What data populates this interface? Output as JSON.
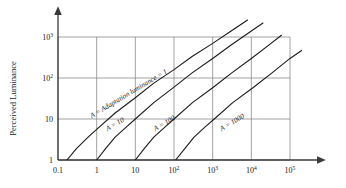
{
  "chart_data": {
    "type": "line",
    "title": "",
    "xlabel": "",
    "ylabel": "Perceived Luminance",
    "x_scale": "log",
    "y_scale": "log",
    "xlim": [
      0.1,
      100000
    ],
    "ylim": [
      1,
      1000
    ],
    "grid": true,
    "legend_position": "inline-curve-labels",
    "x_ticks": [
      {
        "value": 0.1,
        "label": "0.1"
      },
      {
        "value": 1,
        "label": "1"
      },
      {
        "value": 10,
        "label": "10"
      },
      {
        "value": 100,
        "base": "10",
        "exp": "2"
      },
      {
        "value": 1000,
        "base": "10",
        "exp": "3"
      },
      {
        "value": 10000,
        "base": "10",
        "exp": "4"
      },
      {
        "value": 100000,
        "base": "10",
        "exp": "5"
      }
    ],
    "y_ticks": [
      {
        "value": 1,
        "label": "1"
      },
      {
        "value": 10,
        "label": "10"
      },
      {
        "value": 100,
        "base": "10",
        "exp": "2"
      },
      {
        "value": 1000,
        "base": "10",
        "exp": "3"
      }
    ],
    "series": [
      {
        "name": "A = Adaptation luminance = 1",
        "label": "A = Adaptation luminance = 1",
        "adaptation_luminance": 1,
        "color": "#1a1a1a",
        "points": [
          {
            "x": 0.17,
            "y": 1
          },
          {
            "x": 0.3,
            "y": 1.9
          },
          {
            "x": 0.6,
            "y": 3.6
          },
          {
            "x": 1,
            "y": 5.6
          },
          {
            "x": 3,
            "y": 14
          },
          {
            "x": 10,
            "y": 33
          },
          {
            "x": 30,
            "y": 75
          },
          {
            "x": 100,
            "y": 160
          },
          {
            "x": 300,
            "y": 340
          },
          {
            "x": 1000,
            "y": 700
          },
          {
            "x": 3000,
            "y": 1400
          },
          {
            "x": 8000,
            "y": 2600
          }
        ]
      },
      {
        "name": "A = 10",
        "label": "A = 10",
        "adaptation_luminance": 10,
        "color": "#1a1a1a",
        "points": [
          {
            "x": 1,
            "y": 1
          },
          {
            "x": 1.7,
            "y": 1.9
          },
          {
            "x": 3,
            "y": 3.6
          },
          {
            "x": 6,
            "y": 6.5
          },
          {
            "x": 10,
            "y": 10
          },
          {
            "x": 30,
            "y": 25
          },
          {
            "x": 100,
            "y": 60
          },
          {
            "x": 300,
            "y": 135
          },
          {
            "x": 1000,
            "y": 300
          },
          {
            "x": 3000,
            "y": 640
          },
          {
            "x": 10000,
            "y": 1400
          },
          {
            "x": 20000,
            "y": 2200
          }
        ]
      },
      {
        "name": "A = 100",
        "label": "A = 100",
        "adaptation_luminance": 100,
        "color": "#1a1a1a",
        "points": [
          {
            "x": 10,
            "y": 1
          },
          {
            "x": 17,
            "y": 1.9
          },
          {
            "x": 30,
            "y": 3.6
          },
          {
            "x": 60,
            "y": 6.5
          },
          {
            "x": 100,
            "y": 10
          },
          {
            "x": 300,
            "y": 25
          },
          {
            "x": 1000,
            "y": 58
          },
          {
            "x": 3000,
            "y": 130
          },
          {
            "x": 10000,
            "y": 300
          },
          {
            "x": 30000,
            "y": 660
          },
          {
            "x": 60000,
            "y": 1100
          }
        ]
      },
      {
        "name": "A = 1000",
        "label": "A = 1000",
        "adaptation_luminance": 1000,
        "color": "#1a1a1a",
        "points": [
          {
            "x": 110,
            "y": 1
          },
          {
            "x": 190,
            "y": 1.9
          },
          {
            "x": 330,
            "y": 3.6
          },
          {
            "x": 650,
            "y": 6.5
          },
          {
            "x": 1100,
            "y": 10
          },
          {
            "x": 3300,
            "y": 25
          },
          {
            "x": 11000,
            "y": 58
          },
          {
            "x": 33000,
            "y": 130
          },
          {
            "x": 100000,
            "y": 300
          },
          {
            "x": 200000,
            "y": 470
          }
        ]
      }
    ],
    "colors": {
      "grid": "#8a8a8a",
      "axis": "#3a3a3a",
      "curve": "#1a1a1a",
      "text": "#222222",
      "background": "#ffffff"
    }
  }
}
